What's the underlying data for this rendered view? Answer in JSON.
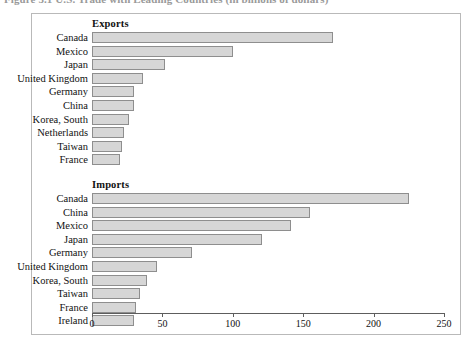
{
  "caption": "Figure 5.1   U.S. Trade with Leading Countries (in billions of dollars)",
  "chart_data": {
    "type": "bar",
    "orientation": "horizontal",
    "title": "U.S. Trade with Leading Countries (in billions of dollars)",
    "xlabel": "",
    "ylabel": "",
    "xlim": [
      0,
      250
    ],
    "xticks": [
      0,
      50,
      100,
      150,
      200,
      250
    ],
    "grid": false,
    "legend": "none",
    "panels": [
      {
        "title": "Exports",
        "categories": [
          "Canada",
          "Mexico",
          "Japan",
          "United Kingdom",
          "Germany",
          "China",
          "Korea, South",
          "Netherlands",
          "Taiwan",
          "France"
        ],
        "values": [
          171,
          100,
          52,
          36,
          30,
          30,
          26,
          23,
          21,
          20
        ]
      },
      {
        "title": "Imports",
        "categories": [
          "Canada",
          "China",
          "Mexico",
          "Japan",
          "Germany",
          "United Kingdom",
          "Korea, South",
          "Taiwan",
          "France",
          "Ireland"
        ],
        "values": [
          225,
          155,
          141,
          121,
          71,
          46,
          39,
          34,
          31,
          30
        ]
      }
    ]
  },
  "colors": {
    "bar_fill": "#d6d6d6",
    "bar_stroke": "#8e8e8e",
    "frame": "#b9b9b9",
    "axis": "#5d5d5d",
    "text": "#111111"
  }
}
